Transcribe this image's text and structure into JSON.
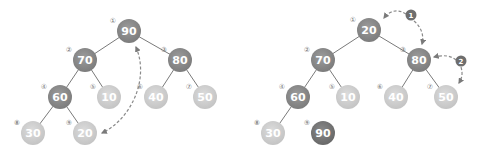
{
  "colors": {
    "dark": "#8c8c8c",
    "darkest": "#777777",
    "light": "#d2d2d2",
    "edge": "#7a7a7a",
    "arrow": "#8a8a8a",
    "index": "#777777"
  },
  "trees": [
    {
      "name": "before",
      "nodes": [
        {
          "idx": "①",
          "value": "90",
          "x": 129,
          "y": 31,
          "shade": "dark"
        },
        {
          "idx": "②",
          "value": "70",
          "x": 85,
          "y": 60,
          "shade": "dark"
        },
        {
          "idx": "③",
          "value": "80",
          "x": 180,
          "y": 60,
          "shade": "dark"
        },
        {
          "idx": "④",
          "value": "60",
          "x": 60,
          "y": 97,
          "shade": "dark"
        },
        {
          "idx": "⑤",
          "value": "10",
          "x": 109,
          "y": 97,
          "shade": "light"
        },
        {
          "idx": "⑥",
          "value": "40",
          "x": 156,
          "y": 97,
          "shade": "light"
        },
        {
          "idx": "⑦",
          "value": "50",
          "x": 205,
          "y": 97,
          "shade": "light"
        },
        {
          "idx": "⑧",
          "value": "30",
          "x": 33,
          "y": 133,
          "shade": "light"
        },
        {
          "idx": "⑨",
          "value": "20",
          "x": 85,
          "y": 133,
          "shade": "light"
        }
      ],
      "edges": [
        [
          0,
          1
        ],
        [
          0,
          2
        ],
        [
          1,
          3
        ],
        [
          1,
          4
        ],
        [
          2,
          5
        ],
        [
          2,
          6
        ],
        [
          3,
          7
        ],
        [
          3,
          8
        ]
      ]
    },
    {
      "name": "after",
      "nodes": [
        {
          "idx": "①",
          "value": "20",
          "x": 369,
          "y": 30,
          "shade": "dark"
        },
        {
          "idx": "②",
          "value": "70",
          "x": 323,
          "y": 60,
          "shade": "dark"
        },
        {
          "idx": "③",
          "value": "80",
          "x": 419,
          "y": 60,
          "shade": "dark"
        },
        {
          "idx": "④",
          "value": "60",
          "x": 298,
          "y": 97,
          "shade": "dark"
        },
        {
          "idx": "⑤",
          "value": "10",
          "x": 348,
          "y": 97,
          "shade": "light"
        },
        {
          "idx": "⑥",
          "value": "40",
          "x": 396,
          "y": 97,
          "shade": "light"
        },
        {
          "idx": "⑦",
          "value": "50",
          "x": 446,
          "y": 97,
          "shade": "light"
        },
        {
          "idx": "⑧",
          "value": "30",
          "x": 273,
          "y": 133,
          "shade": "light"
        },
        {
          "idx": "⑨",
          "value": "90",
          "x": 323,
          "y": 133,
          "shade": "darkest"
        }
      ],
      "edges": [
        [
          0,
          1
        ],
        [
          0,
          2
        ],
        [
          1,
          3
        ],
        [
          1,
          4
        ],
        [
          2,
          5
        ],
        [
          2,
          6
        ],
        [
          3,
          7
        ]
      ]
    }
  ],
  "badges": [
    {
      "label": "1",
      "x": 411,
      "y": 15
    },
    {
      "label": "2",
      "x": 461,
      "y": 61
    }
  ]
}
